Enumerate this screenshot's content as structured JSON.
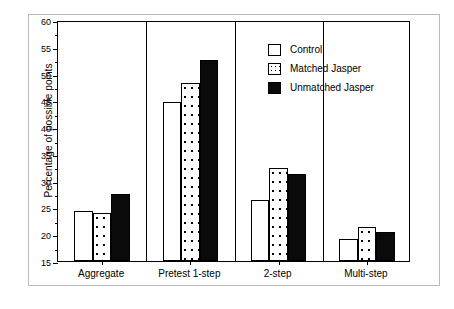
{
  "chart_data": {
    "type": "bar",
    "title": "",
    "xlabel": "",
    "ylabel": "Percentage of possible points",
    "ylim": [
      15,
      60
    ],
    "ytick_step": 5,
    "yticks": [
      15,
      20,
      25,
      30,
      35,
      40,
      45,
      50,
      55,
      60
    ],
    "ytick_labels": [
      "15",
      "20",
      "25",
      "30",
      "35",
      "40",
      "45",
      "50",
      "55",
      "60"
    ],
    "minor_tick_step": 2.5,
    "grid": false,
    "legend_position": "upper right",
    "categories": [
      "Aggregate",
      "Pretest 1-step",
      "2-step",
      "Multi-step"
    ],
    "series": [
      {
        "name": "Control",
        "fill": "white",
        "values": [
          24.4,
          44.7,
          26.4,
          19.2
        ]
      },
      {
        "name": "Matched Jasper",
        "fill": "dotted",
        "values": [
          24.0,
          48.3,
          32.3,
          21.3
        ]
      },
      {
        "name": "Unmatched Jasper",
        "fill": "black",
        "values": [
          27.6,
          52.6,
          31.3,
          20.5
        ]
      }
    ],
    "colors": {
      "control": "#ffffff",
      "matched": "#ffffff",
      "unmatched": "#0a0a0a",
      "outline": "#000000",
      "frame": "#b9b9b9",
      "background": "#ffffff"
    }
  },
  "legend": {
    "items": [
      {
        "label": "Control",
        "style": "control"
      },
      {
        "label": "Matched Jasper",
        "style": "matched"
      },
      {
        "label": "Unmatched Jasper",
        "style": "unmatched"
      }
    ]
  }
}
